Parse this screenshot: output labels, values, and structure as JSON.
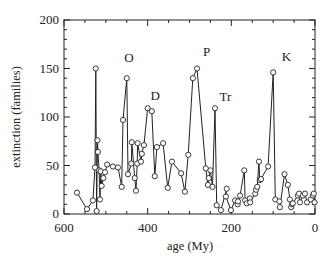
{
  "chart_data": {
    "type": "line",
    "title": "",
    "xlabel": "age (My)",
    "ylabel": "extinction (families)",
    "xlim": [
      600,
      0
    ],
    "ylim": [
      0,
      200
    ],
    "x_ticks": [
      600,
      400,
      200,
      0
    ],
    "y_ticks": [
      0,
      50,
      100,
      150,
      200
    ],
    "grid": false,
    "legend": null,
    "marker": "open-circle",
    "series": [
      {
        "name": "extinction",
        "x": [
          569,
          545,
          531,
          526,
          524,
          522,
          520,
          519,
          516,
          514,
          512,
          510,
          506,
          502,
          497,
          483,
          471,
          462,
          459,
          450,
          447,
          439,
          438,
          431,
          428,
          425,
          424,
          416,
          414,
          409,
          400,
          390,
          383,
          378,
          363,
          352,
          342,
          320,
          311,
          303,
          292,
          282,
          261,
          256,
          254,
          250,
          245,
          239,
          235,
          225,
          211,
          213,
          201,
          191,
          185,
          184,
          179,
          169,
          167,
          163,
          156,
          155,
          143,
          141,
          138,
          134,
          132,
          129,
          112,
          100,
          95,
          85,
          84,
          73,
          65,
          60,
          57,
          55,
          53,
          41,
          38,
          36,
          29,
          24,
          19,
          10,
          5,
          3,
          1
        ],
        "y": [
          22,
          5,
          14,
          48,
          150,
          3,
          76,
          64,
          45,
          15,
          44,
          29,
          37,
          43,
          51,
          49,
          48,
          28,
          97,
          140,
          41,
          52,
          74,
          37,
          24,
          52,
          73,
          54,
          62,
          71,
          109,
          106,
          39,
          69,
          73,
          27,
          54,
          42,
          23,
          61,
          140,
          150,
          47,
          30,
          37,
          45,
          28,
          109,
          9,
          4,
          26,
          18,
          4,
          14,
          10,
          13,
          19,
          45,
          14,
          11,
          16,
          12,
          21,
          25,
          28,
          54,
          35,
          36,
          49,
          146,
          15,
          13,
          7,
          41,
          30,
          15,
          7,
          10,
          11,
          19,
          21,
          12,
          19,
          21,
          12,
          15,
          19,
          21,
          12
        ]
      }
    ],
    "annotations": [
      {
        "text": "O",
        "x": 445,
        "y": 157
      },
      {
        "text": "D",
        "x": 382,
        "y": 118
      },
      {
        "text": "P",
        "x": 259,
        "y": 163
      },
      {
        "text": "Tr",
        "x": 214,
        "y": 117
      },
      {
        "text": "K",
        "x": 68,
        "y": 158
      }
    ]
  },
  "axis": {
    "x_tick_labels": [
      "600",
      "400",
      "200",
      "0"
    ],
    "y_tick_labels": [
      "0",
      "50",
      "100",
      "150",
      "200"
    ],
    "xlabel": "age (My)",
    "ylabel": "extinction (families)"
  },
  "events": [
    "O",
    "D",
    "P",
    "Tr",
    "K"
  ]
}
